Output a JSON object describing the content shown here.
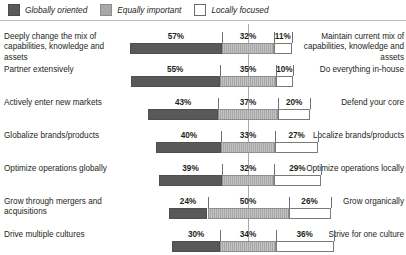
{
  "legend": {
    "items": [
      {
        "label": "Globally oriented",
        "swatch": "dark-swatch-icon",
        "color": "#595959"
      },
      {
        "label": "Equally important",
        "swatch": "mid-swatch-icon",
        "color": "#a8a8a8"
      },
      {
        "label": "Locally focused",
        "swatch": "light-swatch-icon",
        "color": "#ffffff"
      }
    ]
  },
  "chart_data": {
    "type": "bar",
    "subtype": "diverging-100-percent-stacked",
    "title": "",
    "xlabel": "",
    "ylabel": "",
    "grid": false,
    "legend_position": "top-left",
    "legend_entries": [
      "Globally oriented",
      "Equally important",
      "Locally focused"
    ],
    "series": [
      {
        "name": "Globally oriented",
        "color": "#595959",
        "values": [
          57,
          55,
          43,
          40,
          39,
          24,
          30
        ]
      },
      {
        "name": "Equally important",
        "color": "#a8a8a8",
        "values": [
          32,
          35,
          37,
          33,
          32,
          50,
          34
        ]
      },
      {
        "name": "Locally focused",
        "color": "#ffffff",
        "values": [
          11,
          10,
          20,
          27,
          29,
          26,
          36
        ]
      }
    ],
    "categories": [
      "Deeply change the mix of capabilities, knowledge and assets",
      "Partner extensively",
      "Actively enter new markets",
      "Globalize brands/products",
      "Optimize operations globally",
      "Grow through mergers and acquisitions",
      "Drive multiple cultures"
    ],
    "categories_right": [
      "Maintain current mix of capabilities, knowledge and assets",
      "Do everything in-house",
      "Defend your core",
      "Localize brands/products",
      "Optimize operations locally",
      "Grow organically",
      "Strive for one culture"
    ]
  },
  "rows": [
    {
      "left_label": "Deeply change the mix of capabilities, knowledge and assets",
      "right_label": "Maintain current mix of capabilities, knowledge and assets",
      "left_value": "57%",
      "mid_value": "32%",
      "right_value": "11%",
      "left_pct": 57,
      "mid_pct": 32,
      "right_pct": 11
    },
    {
      "left_label": "Partner extensively",
      "right_label": "Do everything in-house",
      "left_value": "55%",
      "mid_value": "35%",
      "right_value": "10%",
      "left_pct": 55,
      "mid_pct": 35,
      "right_pct": 10
    },
    {
      "left_label": "Actively enter new markets",
      "right_label": "Defend your core",
      "left_value": "43%",
      "mid_value": "37%",
      "right_value": "20%",
      "left_pct": 43,
      "mid_pct": 37,
      "right_pct": 20
    },
    {
      "left_label": "Globalize brands/products",
      "right_label": "Localize brands/products",
      "left_value": "40%",
      "mid_value": "33%",
      "right_value": "27%",
      "left_pct": 40,
      "mid_pct": 33,
      "right_pct": 27
    },
    {
      "left_label": "Optimize operations globally",
      "right_label": "Optimize operations locally",
      "left_value": "39%",
      "mid_value": "32%",
      "right_value": "29%",
      "left_pct": 39,
      "mid_pct": 32,
      "right_pct": 29
    },
    {
      "left_label": "Grow through mergers and acquisitions",
      "right_label": "Grow organically",
      "left_value": "24%",
      "mid_value": "50%",
      "right_value": "26%",
      "left_pct": 24,
      "mid_pct": 50,
      "right_pct": 26
    },
    {
      "left_label": "Drive multiple cultures",
      "right_label": "Strive for one culture",
      "left_value": "30%",
      "mid_value": "34%",
      "right_value": "36%",
      "left_pct": 30,
      "mid_pct": 34,
      "right_pct": 36
    }
  ]
}
